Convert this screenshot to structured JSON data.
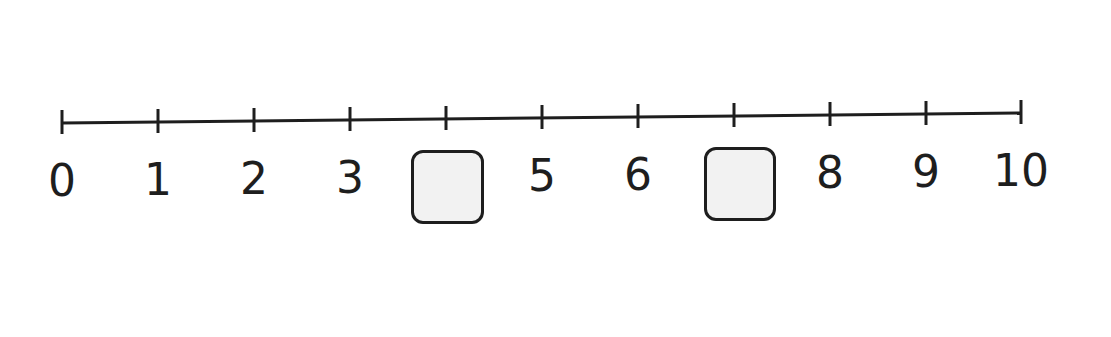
{
  "number_line": {
    "min": 0,
    "max": 10,
    "line_color": "#1e1e1e",
    "box_fill": "#f2f2f2",
    "ticks": [
      {
        "value": 0,
        "label": "0",
        "x": 62,
        "y": 123,
        "blank": false
      },
      {
        "value": 1,
        "label": "1",
        "x": 158,
        "y": 122,
        "blank": false
      },
      {
        "value": 2,
        "label": "2",
        "x": 254,
        "y": 121,
        "blank": false
      },
      {
        "value": 3,
        "label": "3",
        "x": 350,
        "y": 120,
        "blank": false
      },
      {
        "value": 4,
        "label": "",
        "x": 446,
        "y": 119,
        "blank": true
      },
      {
        "value": 5,
        "label": "5",
        "x": 542,
        "y": 118,
        "blank": false
      },
      {
        "value": 6,
        "label": "6",
        "x": 638,
        "y": 117,
        "blank": false
      },
      {
        "value": 7,
        "label": "",
        "x": 734,
        "y": 116,
        "blank": true
      },
      {
        "value": 8,
        "label": "8",
        "x": 830,
        "y": 115,
        "blank": false
      },
      {
        "value": 9,
        "label": "9",
        "x": 926,
        "y": 114,
        "blank": false
      },
      {
        "value": 10,
        "label": "10",
        "x": 1021,
        "y": 113,
        "blank": false
      }
    ],
    "blank_boxes": [
      {
        "for_value": 4,
        "x": 411,
        "y": 150,
        "w": 73,
        "h": 74
      },
      {
        "for_value": 7,
        "x": 704,
        "y": 147,
        "w": 72,
        "h": 74
      }
    ]
  }
}
